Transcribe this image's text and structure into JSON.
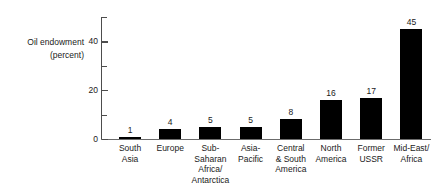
{
  "chart_data": {
    "type": "bar",
    "title": "",
    "subtitle": "",
    "xlabel": "",
    "ylabel": "Oil endowment (percent)",
    "ylabel_lines": [
      "Oil endowment",
      "(percent)"
    ],
    "ylim": [
      0,
      50
    ],
    "ytick_labels": [
      "0",
      "20",
      "40"
    ],
    "ytick_values": [
      0,
      20,
      40
    ],
    "yticks_all": [
      0,
      10,
      20,
      30,
      40,
      50
    ],
    "grid": false,
    "legend": null,
    "bar_color": "#000000",
    "axis_color": "#4d4d4d",
    "background": "#ffffff",
    "categories": [
      "South Asia",
      "Europe",
      "Sub-Saharan Africa/ Antarctica",
      "Asia-Pacific",
      "Central & South America",
      "North America",
      "Former USSR",
      "Mid-East/ Africa"
    ],
    "category_lines": [
      [
        "South",
        "Asia"
      ],
      [
        "Europe"
      ],
      [
        "Sub-",
        "Saharan",
        "Africa/",
        "Antarctica"
      ],
      [
        "Asia-",
        "Pacific"
      ],
      [
        "Central",
        "& South",
        "America"
      ],
      [
        "North",
        "America"
      ],
      [
        "Former",
        "USSR"
      ],
      [
        "Mid-East/",
        "Africa"
      ]
    ],
    "values": [
      1,
      4,
      5,
      5,
      8,
      16,
      17,
      45
    ],
    "value_labels": [
      "1",
      "4",
      "5",
      "5",
      "8",
      "16",
      "17",
      "45"
    ]
  }
}
